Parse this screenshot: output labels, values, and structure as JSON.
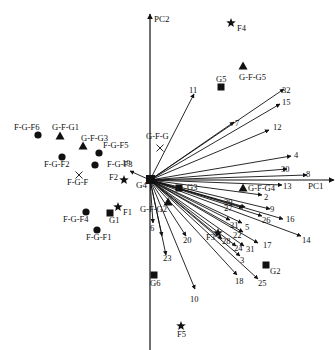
{
  "chart_data": {
    "type": "scatter",
    "subtype": "pca-biplot",
    "title": "",
    "xlabel": "PC1",
    "ylabel": "PC2",
    "axes": {
      "origin_px": [
        150,
        180
      ],
      "x_axis_px": [
        150,
        336
      ],
      "y_axis_px": [
        350,
        14
      ],
      "grid": false,
      "tick_labels": false
    },
    "origin_label": "G4",
    "legend": null,
    "loading_vectors": [
      {
        "label": "32",
        "end": [
          284,
          89
        ],
        "label_pos": [
          282,
          93
        ]
      },
      {
        "label": "15",
        "end": [
          280,
          104
        ],
        "label_pos": [
          282,
          105
        ]
      },
      {
        "label": "7",
        "end": [
          234,
          122
        ],
        "label_pos": [
          235,
          126
        ]
      },
      {
        "label": "12",
        "end": [
          269,
          130
        ],
        "label_pos": [
          273,
          130
        ]
      },
      {
        "label": "4",
        "end": [
          291,
          156
        ],
        "label_pos": [
          294,
          158
        ]
      },
      {
        "label": "30",
        "end": [
          287,
          169
        ],
        "label_pos": [
          281,
          172
        ]
      },
      {
        "label": "8",
        "end": [
          307,
          175
        ],
        "label_pos": [
          306,
          177
        ]
      },
      {
        "label": "13",
        "end": [
          282,
          185
        ],
        "label_pos": [
          283,
          189
        ]
      },
      {
        "label": "2",
        "end": [
          262,
          195
        ],
        "label_pos": [
          264,
          200
        ]
      },
      {
        "label": "9",
        "end": [
          270,
          209
        ],
        "label_pos": [
          270,
          212
        ]
      },
      {
        "label": "16",
        "end": [
          283,
          219
        ],
        "label_pos": [
          286,
          222
        ]
      },
      {
        "label": "26",
        "end": [
          262,
          216
        ],
        "label_pos": [
          262,
          223
        ]
      },
      {
        "label": "14",
        "end": [
          301,
          236
        ],
        "label_pos": [
          302,
          243
        ]
      },
      {
        "label": "29",
        "end": [
          245,
          207
        ],
        "label_pos": [
          224,
          205
        ]
      },
      {
        "label": "27",
        "end": [
          243,
          208
        ],
        "label_pos": [
          224,
          211
        ]
      },
      {
        "label": "21",
        "end": [
          230,
          220
        ],
        "label_pos": [
          230,
          228
        ]
      },
      {
        "label": "5",
        "end": [
          242,
          223
        ],
        "label_pos": [
          245,
          230
        ]
      },
      {
        "label": "22",
        "end": [
          243,
          232
        ],
        "label_pos": [
          233,
          238
        ]
      },
      {
        "label": "17",
        "end": [
          258,
          243
        ],
        "label_pos": [
          263,
          248
        ]
      },
      {
        "label": "28",
        "end": [
          222,
          239
        ],
        "label_pos": [
          222,
          244
        ]
      },
      {
        "label": "24",
        "end": [
          236,
          246
        ],
        "label_pos": [
          234,
          251
        ]
      },
      {
        "label": "31",
        "end": [
          244,
          246
        ],
        "label_pos": [
          246,
          252
        ]
      },
      {
        "label": "3",
        "end": [
          240,
          256
        ],
        "label_pos": [
          240,
          263
        ]
      },
      {
        "label": "18",
        "end": [
          237,
          275
        ],
        "label_pos": [
          235,
          284
        ]
      },
      {
        "label": "25",
        "end": [
          258,
          279
        ],
        "label_pos": [
          258,
          286
        ]
      },
      {
        "label": "20",
        "end": [
          186,
          236
        ],
        "label_pos": [
          183,
          243
        ]
      },
      {
        "label": "10",
        "end": [
          195,
          289
        ],
        "label_pos": [
          190,
          302
        ]
      },
      {
        "label": "23",
        "end": [
          166,
          255
        ],
        "label_pos": [
          163,
          261
        ]
      },
      {
        "label": "6",
        "end": [
          153,
          223
        ],
        "label_pos": [
          150,
          231
        ]
      },
      {
        "label": "1",
        "end": [
          162,
          236
        ],
        "label_pos": null
      },
      {
        "label": "11",
        "end": [
          194,
          94
        ],
        "label_pos": [
          189,
          93
        ]
      },
      {
        "label": "19",
        "end": [
          130,
          171
        ],
        "label_pos": [
          122,
          166
        ]
      }
    ],
    "points": [
      {
        "label": "F-G-F6",
        "group": "F-G-F",
        "marker": "circle",
        "x": 38,
        "y": 135,
        "label_pos": [
          14,
          130
        ]
      },
      {
        "label": "F-G-F2",
        "group": "F-G-F",
        "marker": "circle",
        "x": 62,
        "y": 157,
        "label_pos": [
          44,
          167
        ]
      },
      {
        "label": "F-G-F5",
        "group": "F-G-F",
        "marker": "circle",
        "x": 99,
        "y": 153,
        "label_pos": [
          103,
          148
        ]
      },
      {
        "label": "F-G-F3",
        "group": "F-G-F",
        "marker": "circle",
        "x": 95,
        "y": 165,
        "label_pos": [
          107,
          167
        ]
      },
      {
        "label": "F-G-F4",
        "group": "F-G-F",
        "marker": "circle",
        "x": 86,
        "y": 212,
        "label_pos": [
          63,
          222
        ]
      },
      {
        "label": "F-G-F1",
        "group": "F-G-F",
        "marker": "circle",
        "x": 97,
        "y": 230,
        "label_pos": [
          86,
          240
        ]
      },
      {
        "label": "F-G-F",
        "group": "centroid",
        "marker": "cross",
        "x": 79,
        "y": 175,
        "label_pos": [
          67,
          185
        ]
      },
      {
        "label": "G-F-G1",
        "group": "G-F-G",
        "marker": "triangle",
        "x": 60,
        "y": 136,
        "label_pos": [
          52,
          130
        ]
      },
      {
        "label": "G-F-G3",
        "group": "G-F-G",
        "marker": "triangle",
        "x": 83,
        "y": 146,
        "label_pos": [
          81,
          141
        ]
      },
      {
        "label": "G-F-G5",
        "group": "G-F-G",
        "marker": "triangle",
        "x": 243,
        "y": 66,
        "label_pos": [
          239,
          80
        ]
      },
      {
        "label": "G-F-G4",
        "group": "G-F-G",
        "marker": "triangle",
        "x": 243,
        "y": 188,
        "label_pos": [
          248,
          191
        ]
      },
      {
        "label": "G-F-G2",
        "group": "G-F-G",
        "marker": "triangle",
        "x": 168,
        "y": 202,
        "label_pos": [
          140,
          212
        ]
      },
      {
        "label": "G-F-G",
        "group": "centroid",
        "marker": "cross",
        "x": 160,
        "y": 148,
        "label_pos": [
          146,
          139
        ]
      },
      {
        "label": "G1",
        "group": "G",
        "marker": "square",
        "x": 110,
        "y": 213,
        "label_pos": [
          109,
          223
        ]
      },
      {
        "label": "G2",
        "group": "G",
        "marker": "square",
        "x": 266,
        "y": 265,
        "label_pos": [
          270,
          274
        ]
      },
      {
        "label": "G3",
        "group": "G",
        "marker": "square",
        "x": 179,
        "y": 188,
        "label_pos": [
          187,
          190
        ]
      },
      {
        "label": "G5",
        "group": "G",
        "marker": "square",
        "x": 221,
        "y": 87,
        "label_pos": [
          216,
          82
        ]
      },
      {
        "label": "G6",
        "group": "G",
        "marker": "square",
        "x": 154,
        "y": 275,
        "label_pos": [
          150,
          286
        ]
      },
      {
        "label": "F1",
        "group": "F",
        "marker": "star",
        "x": 118,
        "y": 207,
        "label_pos": [
          123,
          215
        ]
      },
      {
        "label": "F2",
        "group": "F",
        "marker": "star",
        "x": 124,
        "y": 180,
        "label_pos": [
          109,
          180
        ]
      },
      {
        "label": "F3",
        "group": "F",
        "marker": "star",
        "x": 218,
        "y": 233,
        "label_pos": [
          206,
          240
        ]
      },
      {
        "label": "F4",
        "group": "F",
        "marker": "star",
        "x": 231,
        "y": 23,
        "label_pos": [
          237,
          31
        ]
      },
      {
        "label": "F5",
        "group": "F",
        "marker": "star",
        "x": 181,
        "y": 326,
        "label_pos": [
          177,
          337
        ]
      }
    ]
  }
}
